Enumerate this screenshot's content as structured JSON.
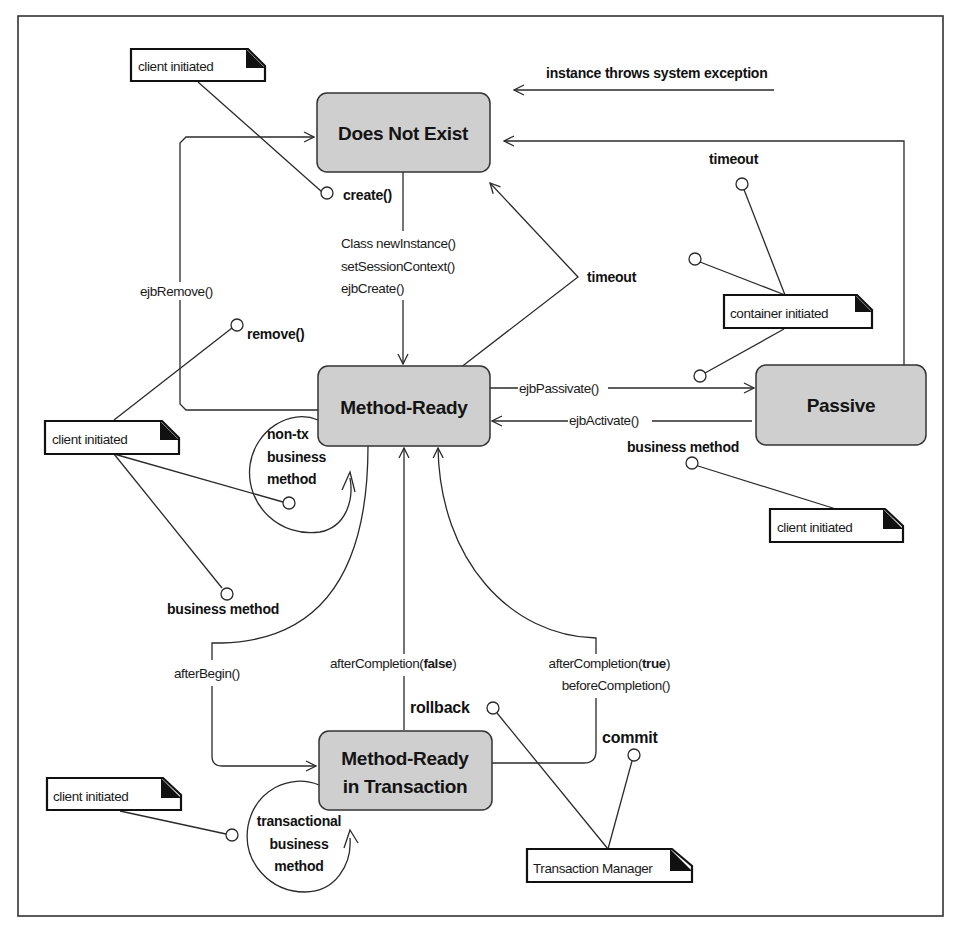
{
  "diagram": {
    "type": "UML state diagram",
    "states": {
      "does_not_exist": "Does Not  Exist",
      "method_ready": "Method-Ready",
      "passive": "Passive",
      "method_ready_tx_line1": "Method-Ready",
      "method_ready_tx_line2": "in Transaction"
    },
    "notes": {
      "client_initiated_top": "client initiated",
      "client_initiated_left": "client initiated",
      "client_initiated_right": "client initiated",
      "client_initiated_bottom": "client initiated",
      "container_initiated": "container initiated",
      "transaction_manager": "Transaction Manager"
    },
    "events": {
      "instance_throws": "instance throws system exception",
      "create": "create()",
      "remove": "remove()",
      "timeout_center": "timeout",
      "timeout_right": "timeout",
      "business_method_right": "business method",
      "business_method_left": "business method",
      "non_tx_line1": "non-tx",
      "non_tx_line2": "business",
      "non_tx_line3": "method",
      "tx_line1": "transactional",
      "tx_line2": "business",
      "tx_line3": "method",
      "rollback": "rollback",
      "commit": "commit"
    },
    "methods": {
      "class_new_instance": "Class newInstance()",
      "set_session_context": "setSessionContext()",
      "ejb_create": "ejbCreate()",
      "ejb_remove": "ejbRemove()",
      "ejb_passivate": "ejbPassivate()",
      "ejb_activate": "ejbActivate()",
      "after_begin": "afterBegin()",
      "after_completion_false_prefix": "afterCompletion(",
      "after_completion_false_bold": "false",
      "after_completion_false_suffix": ")",
      "after_completion_true_prefix": "afterCompletion(",
      "after_completion_true_bold": "true",
      "after_completion_true_suffix": ")",
      "before_completion": "beforeCompletion()"
    },
    "colors": {
      "state_fill": "#cfcfcf",
      "stroke": "#2a2a2a",
      "note_corner": "#111111",
      "background": "#ffffff"
    }
  }
}
